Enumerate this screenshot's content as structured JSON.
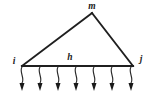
{
  "figure": {
    "kind": "structural-truss-load-diagram",
    "background_color": "#ffffff",
    "line_color": "#1f1f1f",
    "label_color": "#1a1a1a",
    "labels": {
      "apex_node": "m",
      "left_node": "i",
      "right_node": "j",
      "bottom_member": "h"
    },
    "geometry": {
      "apex": {
        "x": 92,
        "y": 13
      },
      "left_support": {
        "x": 22,
        "y": 66
      },
      "right_support": {
        "x": 133,
        "y": 66
      }
    },
    "label_positions": {
      "apex_node": {
        "x": 92,
        "y": 9
      },
      "left_node": {
        "x": 14,
        "y": 64
      },
      "right_node": {
        "x": 141,
        "y": 62
      },
      "bottom_member": {
        "x": 70,
        "y": 60
      }
    },
    "loads": {
      "count": 7,
      "direction": "down",
      "x_positions": [
        22,
        40,
        58,
        76,
        94,
        112,
        131
      ],
      "start_y": 67,
      "tip_y": 91,
      "head_width": 5,
      "head_length": 8,
      "stem_wave_offset": 3.2
    }
  }
}
